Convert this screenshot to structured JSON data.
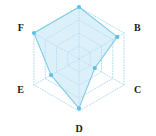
{
  "chart_data": {
    "type": "radar",
    "title": "",
    "categories": [
      "A",
      "B",
      "C",
      "D",
      "E",
      "F"
    ],
    "visible_labels": [
      "B",
      "C",
      "D",
      "E",
      "F"
    ],
    "series": [
      {
        "name": "series-1",
        "values": [
          1.0,
          0.85,
          0.35,
          0.95,
          0.62,
          1.0
        ]
      }
    ],
    "rlim": [
      0,
      1
    ],
    "rings": 4,
    "grid": "dotted",
    "legend": "none",
    "xlabel": "",
    "ylabel": "",
    "colors": {
      "grid": "#a9d7ef",
      "fill": "#bfe4f5",
      "line": "#7ecbea",
      "marker": "#5fbfe4",
      "label": "#1a1a1a",
      "background": "#ffffff"
    },
    "geometry": {
      "center_x": 79,
      "center_y": 59,
      "outer_radius": 52,
      "axis_angles_deg": [
        90,
        30,
        -30,
        -90,
        -150,
        150
      ]
    }
  },
  "labels": {
    "a": "A",
    "b": "B",
    "c": "C",
    "d": "D",
    "e": "E",
    "f": "F"
  }
}
